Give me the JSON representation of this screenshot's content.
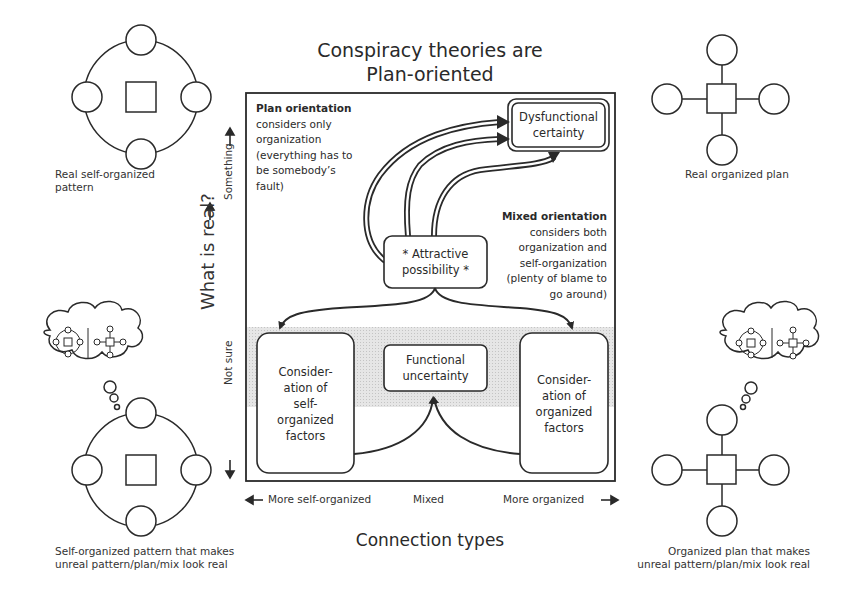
{
  "title": {
    "line1": "Conspiracy theories are",
    "line2": "Plan-oriented"
  },
  "y_axis": {
    "label": "What is real?",
    "top_label": "Something",
    "bottom_label": "Not sure"
  },
  "x_axis": {
    "label": "Connection types",
    "left": "More self-organized",
    "middle": "Mixed",
    "right": "More organized"
  },
  "corners": {
    "top_left": {
      "line1": "Real self-organized",
      "line2": "pattern",
      "icon": "self-organized-ring-icon"
    },
    "top_right": {
      "line1": "Real organized plan",
      "icon": "organized-hub-icon"
    },
    "bottom_left": {
      "line1": "Self-organized pattern that makes",
      "line2": "unreal pattern/plan/mix look real",
      "icon": "self-organized-ring-with-thought-icon"
    },
    "bottom_right": {
      "line1": "Organized plan that makes",
      "line2": "unreal pattern/plan/mix look real",
      "icon": "organized-hub-with-thought-icon"
    }
  },
  "notes": {
    "plan": {
      "heading": "Plan orientation",
      "lines": [
        "considers only",
        "organization",
        "(everything has to",
        "be somebody’s",
        "fault)"
      ]
    },
    "mixed": {
      "heading": "Mixed orientation",
      "lines": [
        "considers both",
        "organization and",
        "self-organization",
        "(plenty of blame to",
        "go around)"
      ]
    }
  },
  "nodes": {
    "dysfunctional": {
      "line1": "Dysfunctional",
      "line2": "certainty"
    },
    "attractive": {
      "line1": "* Attractive",
      "line2": "possibility *"
    },
    "functional": {
      "line1": "Functional",
      "line2": "uncertainty"
    },
    "self_organized": {
      "lines": [
        "Consider-",
        "ation of",
        "self-",
        "organized",
        "factors"
      ]
    },
    "organized": {
      "lines": [
        "Consider-",
        "ation of",
        "organized",
        "factors"
      ]
    }
  },
  "colors": {
    "ink": "#2a2a2a",
    "band": "#d9d9d9",
    "background": "#ffffff"
  }
}
